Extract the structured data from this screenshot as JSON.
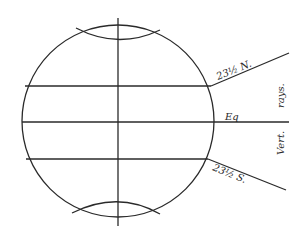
{
  "diagram": {
    "title": "",
    "labels": {
      "tropic_north": "23½ N.",
      "equator": "Eq",
      "tropic_south": "23½ S.",
      "vertical_rays_top": "rays.",
      "vertical_rays_bottom": "Vert."
    },
    "colors": {
      "line": "#2a2a2a",
      "background": "#ffffff"
    }
  }
}
